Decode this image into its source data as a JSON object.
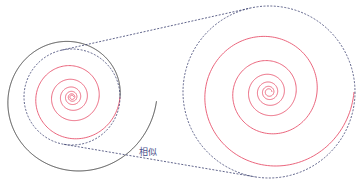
{
  "diagram": {
    "label": "相似",
    "label_pos": {
      "x": 139,
      "y": 145
    },
    "colors": {
      "spiral_red": "#e8556e",
      "spiral_black": "#333333",
      "dashed": "#3a3f6e",
      "label": "#4a4f8a"
    },
    "left_spiral": {
      "cx": 72,
      "cy": 97,
      "outer_r": 48,
      "extension_r": 85
    },
    "left_circle": {
      "cx": 72,
      "cy": 97,
      "r": 48
    },
    "right_spiral": {
      "cx": 269,
      "cy": 92,
      "outer_r": 85
    },
    "right_circle": {
      "cx": 269,
      "cy": 92,
      "r": 86
    },
    "growth_per_turn": 1.77,
    "turns": 6
  }
}
